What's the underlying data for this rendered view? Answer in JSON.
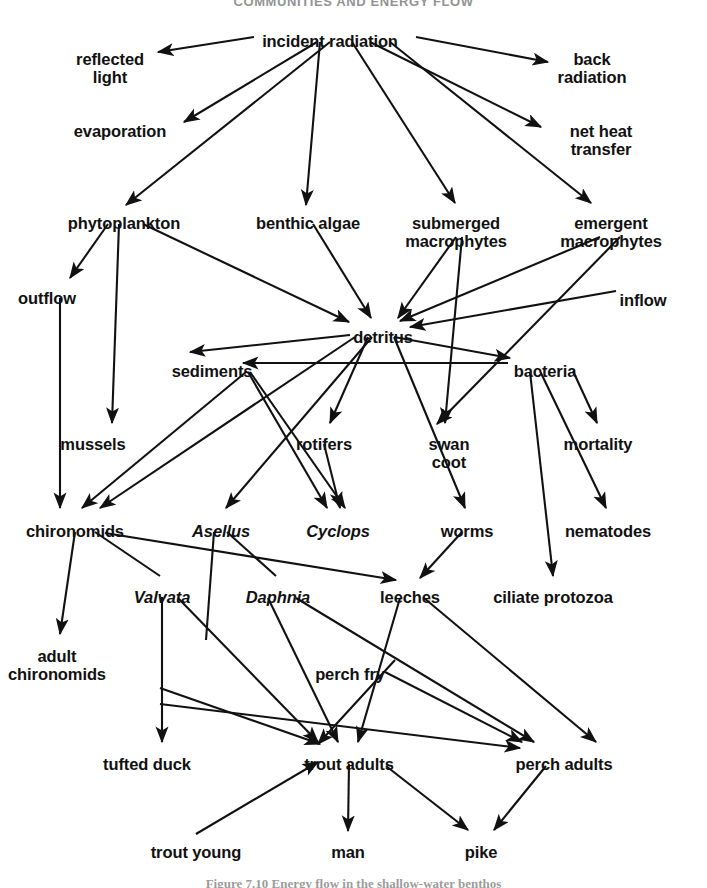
{
  "title": "COMMUNITIES AND ENERGY FLOW",
  "caption": "Figure 7.10   Energy flow in the shallow-water benthos",
  "diagram": {
    "type": "food-web",
    "stroke_color": "#111111",
    "background": "#ffffff",
    "nodes": [
      {
        "id": "incident_radiation",
        "label": "incident radiation",
        "x": 330,
        "y": 32,
        "italic": false
      },
      {
        "id": "reflected_light",
        "label": "reflected\nlight",
        "x": 110,
        "y": 50,
        "italic": false
      },
      {
        "id": "back_radiation",
        "label": "back\nradiation",
        "x": 592,
        "y": 50,
        "italic": false
      },
      {
        "id": "evaporation",
        "label": "evaporation",
        "x": 120,
        "y": 122,
        "italic": false
      },
      {
        "id": "net_heat_transfer",
        "label": "net heat\ntransfer",
        "x": 601,
        "y": 122,
        "italic": false
      },
      {
        "id": "phytoplankton",
        "label": "phytoplankton",
        "x": 124,
        "y": 214,
        "italic": false
      },
      {
        "id": "benthic_algae",
        "label": "benthic algae",
        "x": 308,
        "y": 214,
        "italic": false
      },
      {
        "id": "submerged_macrophytes",
        "label": "submerged\nmacrophytes",
        "x": 456,
        "y": 214,
        "italic": false
      },
      {
        "id": "emergent_macrophytes",
        "label": "emergent\nmacrophytes",
        "x": 611,
        "y": 214,
        "italic": false
      },
      {
        "id": "outflow",
        "label": "outflow",
        "x": 47,
        "y": 289,
        "italic": false
      },
      {
        "id": "inflow",
        "label": "inflow",
        "x": 643,
        "y": 291,
        "italic": false
      },
      {
        "id": "detritus",
        "label": "detritus",
        "x": 383,
        "y": 328,
        "italic": false
      },
      {
        "id": "sediments",
        "label": "sediments",
        "x": 212,
        "y": 362,
        "italic": false
      },
      {
        "id": "bacteria",
        "label": "bacteria",
        "x": 545,
        "y": 362,
        "italic": false
      },
      {
        "id": "mussels",
        "label": "mussels",
        "x": 93,
        "y": 435,
        "italic": false
      },
      {
        "id": "rotifers",
        "label": "rotifers",
        "x": 324,
        "y": 435,
        "italic": false
      },
      {
        "id": "swan_coot",
        "label": "swan\ncoot",
        "x": 449,
        "y": 435,
        "italic": false
      },
      {
        "id": "mortality",
        "label": "mortality",
        "x": 598,
        "y": 435,
        "italic": false
      },
      {
        "id": "chironomids",
        "label": "chironomids",
        "x": 75,
        "y": 522,
        "italic": false
      },
      {
        "id": "asellus",
        "label": "Asellus",
        "x": 221,
        "y": 522,
        "italic": true
      },
      {
        "id": "cyclops",
        "label": "Cyclops",
        "x": 338,
        "y": 522,
        "italic": true
      },
      {
        "id": "worms",
        "label": "worms",
        "x": 467,
        "y": 522,
        "italic": false
      },
      {
        "id": "nematodes",
        "label": "nematodes",
        "x": 608,
        "y": 522,
        "italic": false
      },
      {
        "id": "valvata",
        "label": "Valvata",
        "x": 162,
        "y": 588,
        "italic": true
      },
      {
        "id": "daphnia",
        "label": "Daphnia",
        "x": 278,
        "y": 588,
        "italic": true
      },
      {
        "id": "leeches",
        "label": "leeches",
        "x": 410,
        "y": 588,
        "italic": false
      },
      {
        "id": "ciliate_protozoa",
        "label": "ciliate protozoa",
        "x": 553,
        "y": 588,
        "italic": false
      },
      {
        "id": "adult_chironomids",
        "label": "adult\nchironomids",
        "x": 57,
        "y": 647,
        "italic": false
      },
      {
        "id": "perch_fry",
        "label": "perch fry",
        "x": 350,
        "y": 665,
        "italic": false
      },
      {
        "id": "tufted_duck",
        "label": "tufted duck",
        "x": 147,
        "y": 755,
        "italic": false
      },
      {
        "id": "trout_adults",
        "label": "trout adults",
        "x": 349,
        "y": 755,
        "italic": false
      },
      {
        "id": "perch_adults",
        "label": "perch adults",
        "x": 564,
        "y": 755,
        "italic": false
      },
      {
        "id": "trout_young",
        "label": "trout young",
        "x": 196,
        "y": 843,
        "italic": false
      },
      {
        "id": "man",
        "label": "man",
        "x": 348,
        "y": 843,
        "italic": false
      },
      {
        "id": "pike",
        "label": "pike",
        "x": 481,
        "y": 843,
        "italic": false
      }
    ],
    "edges": [
      {
        "from": "incident_radiation",
        "to": "reflected_light",
        "x1": 254,
        "y1": 37,
        "x2": 158,
        "y2": 52,
        "arrow": true
      },
      {
        "from": "incident_radiation",
        "to": "back_radiation",
        "x1": 416,
        "y1": 37,
        "x2": 548,
        "y2": 62,
        "arrow": true
      },
      {
        "from": "incident_radiation",
        "to": "evaporation",
        "x1": 317,
        "y1": 42,
        "x2": 184,
        "y2": 122,
        "arrow": true
      },
      {
        "from": "incident_radiation",
        "to": "net_heat_transfer",
        "x1": 370,
        "y1": 42,
        "x2": 541,
        "y2": 127,
        "arrow": true
      },
      {
        "from": "incident_radiation",
        "to": "phytoplankton",
        "x1": 330,
        "y1": 42,
        "x2": 126,
        "y2": 205,
        "arrow": true
      },
      {
        "from": "incident_radiation",
        "to": "benthic_algae",
        "x1": 320,
        "y1": 42,
        "x2": 306,
        "y2": 205,
        "arrow": true
      },
      {
        "from": "incident_radiation",
        "to": "submerged_macrophytes",
        "x1": 352,
        "y1": 42,
        "x2": 455,
        "y2": 203,
        "arrow": true
      },
      {
        "from": "incident_radiation",
        "to": "emergent_macrophytes",
        "x1": 390,
        "y1": 42,
        "x2": 591,
        "y2": 203,
        "arrow": true
      },
      {
        "from": "phytoplankton",
        "to": "outflow",
        "x1": 108,
        "y1": 224,
        "x2": 70,
        "y2": 278,
        "arrow": true
      },
      {
        "from": "phytoplankton",
        "to": "mussels",
        "x1": 119,
        "y1": 224,
        "x2": 112,
        "y2": 423,
        "arrow": true
      },
      {
        "from": "phytoplankton",
        "to": "detritus",
        "x1": 143,
        "y1": 224,
        "x2": 349,
        "y2": 322,
        "arrow": true
      },
      {
        "from": "benthic_algae",
        "to": "detritus",
        "x1": 313,
        "y1": 224,
        "x2": 371,
        "y2": 318,
        "arrow": true
      },
      {
        "from": "submerged_macrophytes",
        "to": "detritus",
        "x1": 456,
        "y1": 237,
        "x2": 398,
        "y2": 318,
        "arrow": true
      },
      {
        "from": "submerged_macrophytes",
        "to": "swan_coot",
        "x1": 462,
        "y1": 237,
        "x2": 445,
        "y2": 423,
        "arrow": true
      },
      {
        "from": "emergent_macrophytes",
        "to": "detritus",
        "x1": 600,
        "y1": 237,
        "x2": 400,
        "y2": 321,
        "arrow": true
      },
      {
        "from": "emergent_macrophytes",
        "to": "swan_coot",
        "x1": 620,
        "y1": 237,
        "x2": 437,
        "y2": 424,
        "arrow": true
      },
      {
        "from": "inflow",
        "to": "detritus",
        "x1": 616,
        "y1": 291,
        "x2": 410,
        "y2": 327,
        "arrow": true
      },
      {
        "from": "detritus",
        "to": "sediments",
        "x1": 350,
        "y1": 335,
        "x2": 190,
        "y2": 352,
        "arrow": true
      },
      {
        "from": "bacteria",
        "to": "sediments",
        "x1": 508,
        "y1": 363,
        "x2": 243,
        "y2": 363,
        "arrow": true
      },
      {
        "from": "detritus",
        "to": "bacteria",
        "x1": 394,
        "y1": 337,
        "x2": 510,
        "y2": 358,
        "arrow": true
      },
      {
        "from": "detritus",
        "to": "rotifers",
        "x1": 368,
        "y1": 337,
        "x2": 330,
        "y2": 423,
        "arrow": true
      },
      {
        "from": "detritus",
        "to": "chironomids",
        "x1": 355,
        "y1": 337,
        "x2": 100,
        "y2": 508,
        "arrow": true
      },
      {
        "from": "detritus",
        "to": "worms",
        "x1": 394,
        "y1": 337,
        "x2": 465,
        "y2": 508,
        "arrow": true
      },
      {
        "from": "detritus",
        "to": "asellus",
        "x1": 372,
        "y1": 337,
        "x2": 226,
        "y2": 508,
        "arrow": true
      },
      {
        "from": "bacteria",
        "to": "mortality",
        "x1": 573,
        "y1": 371,
        "x2": 597,
        "y2": 423,
        "arrow": true
      },
      {
        "from": "bacteria",
        "to": "nematodes",
        "x1": 540,
        "y1": 371,
        "x2": 606,
        "y2": 508,
        "arrow": true
      },
      {
        "from": "bacteria",
        "to": "ciliate_protozoa",
        "x1": 530,
        "y1": 372,
        "x2": 553,
        "y2": 576,
        "arrow": true
      },
      {
        "from": "sediments",
        "to": "chironomids",
        "x1": 246,
        "y1": 372,
        "x2": 82,
        "y2": 508,
        "arrow": true
      },
      {
        "from": "sediments",
        "to": "cyclops",
        "x1": 248,
        "y1": 372,
        "x2": 327,
        "y2": 508,
        "arrow": true
      },
      {
        "from": "sediments",
        "to": "daphnia",
        "x1": 250,
        "y1": 372,
        "x2": 345,
        "y2": 508,
        "arrow": true
      },
      {
        "from": "rotifers",
        "to": "cyclops",
        "x1": 324,
        "y1": 444,
        "x2": 340,
        "y2": 508,
        "arrow": true
      },
      {
        "from": "outflow",
        "to": "chironomids",
        "x1": 60,
        "y1": 298,
        "x2": 60,
        "y2": 508,
        "arrow": true
      },
      {
        "from": "chironomids",
        "to": "adult_chironomids",
        "x1": 75,
        "y1": 532,
        "x2": 60,
        "y2": 634,
        "arrow": true
      },
      {
        "from": "chironomids",
        "to": "valvata",
        "x1": 95,
        "y1": 532,
        "x2": 160,
        "y2": 576,
        "arrow": false
      },
      {
        "from": "chironomids",
        "to": "leeches",
        "x1": 105,
        "y1": 533,
        "x2": 396,
        "y2": 580,
        "arrow": true
      },
      {
        "from": "asellus",
        "to": "valvata",
        "x1": 214,
        "y1": 532,
        "x2": 206,
        "y2": 640,
        "arrow": false
      },
      {
        "from": "asellus",
        "to": "daphnia",
        "x1": 227,
        "y1": 532,
        "x2": 276,
        "y2": 576,
        "arrow": false
      },
      {
        "from": "worms",
        "to": "leeches",
        "x1": 462,
        "y1": 532,
        "x2": 420,
        "y2": 578,
        "arrow": true
      },
      {
        "from": "valvata",
        "to": "tufted_duck",
        "x1": 162,
        "y1": 597,
        "x2": 162,
        "y2": 742,
        "arrow": true
      },
      {
        "from": "valvata",
        "to": "trout_adults",
        "x1": 178,
        "y1": 598,
        "x2": 318,
        "y2": 742,
        "arrow": true
      },
      {
        "from": "daphnia",
        "to": "trout_adults",
        "x1": 268,
        "y1": 598,
        "x2": 338,
        "y2": 742,
        "arrow": true
      },
      {
        "from": "daphnia",
        "to": "perch_adults",
        "x1": 296,
        "y1": 598,
        "x2": 534,
        "y2": 742,
        "arrow": true
      },
      {
        "from": "leeches",
        "to": "trout_adults",
        "x1": 400,
        "y1": 598,
        "x2": 358,
        "y2": 742,
        "arrow": true
      },
      {
        "from": "leeches",
        "to": "perch_adults",
        "x1": 424,
        "y1": 598,
        "x2": 596,
        "y2": 742,
        "arrow": true
      },
      {
        "from": "perch_fry",
        "to": "trout_adults",
        "x1": 395,
        "y1": 660,
        "x2": 318,
        "y2": 744,
        "arrow": true
      },
      {
        "from": "perch_fry",
        "to": "perch_adults",
        "x1": 385,
        "y1": 672,
        "x2": 522,
        "y2": 742,
        "arrow": true
      },
      {
        "from": "adult_chironomids",
        "to": "trout_adults",
        "x1": 160,
        "y1": 688,
        "x2": 320,
        "y2": 744,
        "arrow": true
      },
      {
        "from": "adult_chironomids",
        "to": "perch_adults",
        "x1": 160,
        "y1": 704,
        "x2": 520,
        "y2": 748,
        "arrow": true
      },
      {
        "from": "trout_young",
        "to": "trout_adults",
        "x1": 196,
        "y1": 834,
        "x2": 318,
        "y2": 762,
        "arrow": true
      },
      {
        "from": "trout_adults",
        "to": "man",
        "x1": 349,
        "y1": 764,
        "x2": 348,
        "y2": 831,
        "arrow": true
      },
      {
        "from": "trout_adults",
        "to": "pike",
        "x1": 386,
        "y1": 766,
        "x2": 468,
        "y2": 830,
        "arrow": true
      },
      {
        "from": "perch_adults",
        "to": "pike",
        "x1": 546,
        "y1": 766,
        "x2": 494,
        "y2": 830,
        "arrow": true
      }
    ]
  }
}
